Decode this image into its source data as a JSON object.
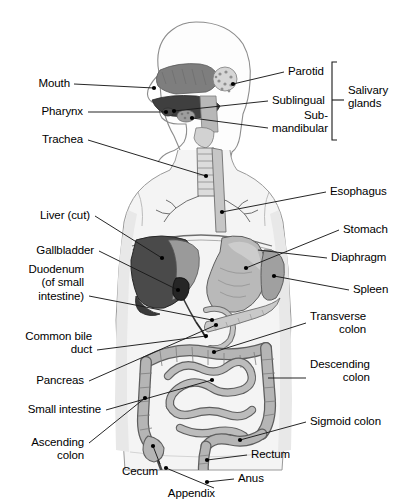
{
  "diagram": {
    "view": "anterior body with sagittal head section",
    "colors": {
      "body_fill": "#f2f2f2",
      "body_outline": "#8c8c8c",
      "organ_light": "#cfcfcf",
      "organ_mid": "#b3b3b3",
      "organ_dark": "#6e6e6e",
      "liver": "#4a4a4a",
      "gallbladder": "#2e2e2e",
      "leader_line": "#1a1a1a",
      "text": "#000000"
    }
  },
  "labels_left": [
    {
      "id": "mouth",
      "text": "Mouth",
      "x": 70,
      "y": 84,
      "lines": 1
    },
    {
      "id": "pharynx",
      "text": "Pharynx",
      "x": 83,
      "y": 112,
      "lines": 1
    },
    {
      "id": "trachea",
      "text": "Trachea",
      "x": 83,
      "y": 140,
      "lines": 1
    },
    {
      "id": "liver-cut",
      "text": "Liver (cut)",
      "x": 90,
      "y": 216,
      "lines": 1
    },
    {
      "id": "gallbladder",
      "text": "Gallbladder",
      "x": 94,
      "y": 251,
      "lines": 1
    },
    {
      "id": "duodenum",
      "text": "Duodenum\n(of small\nintestine)",
      "x": 84,
      "y": 283,
      "lines": 3
    },
    {
      "id": "common-bile-duct",
      "text": "Common bile\nduct",
      "x": 92,
      "y": 343,
      "lines": 2
    },
    {
      "id": "pancreas",
      "text": "Pancreas",
      "x": 84,
      "y": 381,
      "lines": 1
    },
    {
      "id": "small-intestine",
      "text": "Small intestine",
      "x": 101,
      "y": 410,
      "lines": 1
    },
    {
      "id": "ascending-colon",
      "text": "Ascending\ncolon",
      "x": 84,
      "y": 449,
      "lines": 2
    },
    {
      "id": "cecum",
      "text": "Cecum",
      "x": 158,
      "y": 472,
      "lines": 1
    },
    {
      "id": "appendix",
      "text": "Appendix",
      "x": 215,
      "y": 494,
      "lines": 1
    }
  ],
  "labels_right": [
    {
      "id": "parotid",
      "text": "Parotid",
      "x": 288,
      "y": 72,
      "lines": 1
    },
    {
      "id": "sublingual",
      "text": "Sublingual",
      "x": 272,
      "y": 101,
      "lines": 1
    },
    {
      "id": "submandibular",
      "text": "Sub-\nmandibular",
      "x": 272,
      "y": 122,
      "lines": 2
    },
    {
      "id": "salivary-glands",
      "text": "Salivary\nglands",
      "x": 348,
      "y": 97,
      "lines": 2
    },
    {
      "id": "esophagus",
      "text": "Esophagus",
      "x": 330,
      "y": 192,
      "lines": 1
    },
    {
      "id": "stomach",
      "text": "Stomach",
      "x": 343,
      "y": 230,
      "lines": 1
    },
    {
      "id": "diaphragm",
      "text": "Diaphragm",
      "x": 331,
      "y": 258,
      "lines": 1
    },
    {
      "id": "spleen",
      "text": "Spleen",
      "x": 353,
      "y": 290,
      "lines": 1
    },
    {
      "id": "transverse-colon",
      "text": "Transverse\ncolon",
      "x": 310,
      "y": 323,
      "lines": 2
    },
    {
      "id": "descending-colon",
      "text": "Descending\ncolon",
      "x": 310,
      "y": 371,
      "lines": 2
    },
    {
      "id": "sigmoid-colon",
      "text": "Sigmoid colon",
      "x": 310,
      "y": 422,
      "lines": 1
    },
    {
      "id": "rectum",
      "text": "Rectum",
      "x": 251,
      "y": 455,
      "lines": 1
    },
    {
      "id": "anus",
      "text": "Anus",
      "x": 238,
      "y": 479,
      "lines": 1
    }
  ],
  "bracket": {
    "id": "salivary-glands-bracket",
    "x": 332,
    "y_top": 62,
    "y_bottom": 140,
    "tick_x": 340,
    "tick_y": 100
  }
}
